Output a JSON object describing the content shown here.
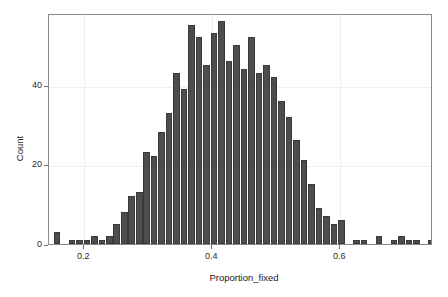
{
  "chart_data": {
    "type": "bar",
    "title": "",
    "subtitle": "",
    "xlabel": "Proportion_fixed",
    "ylabel": "Count",
    "xlim": [
      0.145,
      0.745
    ],
    "ylim": [
      0,
      58
    ],
    "grid": true,
    "legend": null,
    "bar_color": "#4d4d4d",
    "bin_width": 0.0117,
    "xticks": [
      {
        "value": 0.2,
        "label": "0.2"
      },
      {
        "value": 0.4,
        "label": "0.4"
      },
      {
        "value": 0.6,
        "label": "0.6"
      }
    ],
    "yticks": [
      {
        "value": 0,
        "label": "0"
      },
      {
        "value": 20,
        "label": "20"
      },
      {
        "value": 40,
        "label": "40"
      }
    ],
    "bins": [
      {
        "x": 0.158,
        "count": 3
      },
      {
        "x": 0.1697,
        "count": 0
      },
      {
        "x": 0.1814,
        "count": 1
      },
      {
        "x": 0.1931,
        "count": 1
      },
      {
        "x": 0.2048,
        "count": 1
      },
      {
        "x": 0.2165,
        "count": 2
      },
      {
        "x": 0.2282,
        "count": 1
      },
      {
        "x": 0.2399,
        "count": 2
      },
      {
        "x": 0.2516,
        "count": 5
      },
      {
        "x": 0.2633,
        "count": 8
      },
      {
        "x": 0.275,
        "count": 12
      },
      {
        "x": 0.2867,
        "count": 13
      },
      {
        "x": 0.2984,
        "count": 23
      },
      {
        "x": 0.3101,
        "count": 22
      },
      {
        "x": 0.3218,
        "count": 28
      },
      {
        "x": 0.3335,
        "count": 33
      },
      {
        "x": 0.3452,
        "count": 43
      },
      {
        "x": 0.3569,
        "count": 39
      },
      {
        "x": 0.3686,
        "count": 55
      },
      {
        "x": 0.3803,
        "count": 52
      },
      {
        "x": 0.392,
        "count": 45
      },
      {
        "x": 0.4037,
        "count": 53
      },
      {
        "x": 0.4154,
        "count": 56
      },
      {
        "x": 0.4271,
        "count": 46
      },
      {
        "x": 0.4388,
        "count": 50
      },
      {
        "x": 0.4505,
        "count": 44
      },
      {
        "x": 0.4622,
        "count": 52
      },
      {
        "x": 0.4739,
        "count": 43
      },
      {
        "x": 0.4856,
        "count": 45
      },
      {
        "x": 0.4973,
        "count": 42
      },
      {
        "x": 0.509,
        "count": 36
      },
      {
        "x": 0.5207,
        "count": 32
      },
      {
        "x": 0.5324,
        "count": 26
      },
      {
        "x": 0.5441,
        "count": 21
      },
      {
        "x": 0.5558,
        "count": 15
      },
      {
        "x": 0.5675,
        "count": 9
      },
      {
        "x": 0.5792,
        "count": 7
      },
      {
        "x": 0.5909,
        "count": 5
      },
      {
        "x": 0.6026,
        "count": 6
      },
      {
        "x": 0.6143,
        "count": 0
      },
      {
        "x": 0.626,
        "count": 1
      },
      {
        "x": 0.6377,
        "count": 1
      },
      {
        "x": 0.6494,
        "count": 0
      },
      {
        "x": 0.6611,
        "count": 2
      },
      {
        "x": 0.6728,
        "count": 0
      },
      {
        "x": 0.6845,
        "count": 1
      },
      {
        "x": 0.6962,
        "count": 2
      },
      {
        "x": 0.7079,
        "count": 1
      },
      {
        "x": 0.7196,
        "count": 1
      },
      {
        "x": 0.7313,
        "count": 0
      },
      {
        "x": 0.743,
        "count": 1
      },
      {
        "x": 0.7547,
        "count": 0
      },
      {
        "x": 0.7664,
        "count": 0
      },
      {
        "x": 0.7781,
        "count": 1
      }
    ]
  }
}
